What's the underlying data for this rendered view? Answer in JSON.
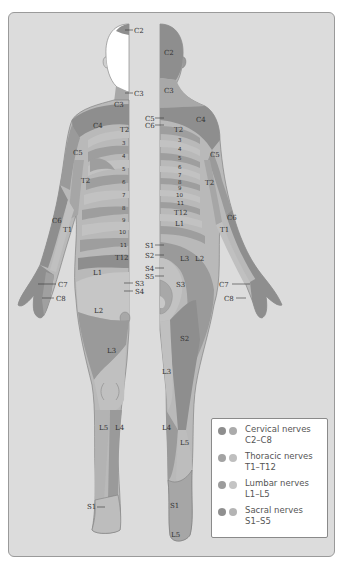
{
  "diagram": {
    "colors": {
      "background": "#dcdcdc",
      "body_light": "#b9b9b9",
      "cervical_dark": "#8e8e8e",
      "cervical_light": "#a8a8a8",
      "thoracic_dark": "#9a9a9a",
      "thoracic_light": "#bdbdbd",
      "lumbar_dark": "#959595",
      "lumbar_light": "#c2c2c2",
      "sacral_dark": "#8a8a8a",
      "sacral_light": "#b0b0b0"
    },
    "front_labels": {
      "c2_head": "C2",
      "c3_neck_arrow": "C3",
      "c3": "C3",
      "c4": "C4",
      "c5": "C5",
      "t2_chest": "T2",
      "t2_arm": "T2",
      "t3": "3",
      "t4": "4",
      "t5": "5",
      "t6": "6",
      "t7": "7",
      "t8": "8",
      "t9": "9",
      "t10": "10",
      "t11": "11",
      "t12": "T12",
      "c6": "C6",
      "t1": "T1",
      "c7": "C7",
      "c8": "C8",
      "l1": "L1",
      "s3": "S3",
      "s4": "S4",
      "l2": "L2",
      "l3": "L3",
      "l5": "L5",
      "l4": "L4",
      "s1": "S1"
    },
    "back_labels": {
      "c2": "C2",
      "c3": "C3",
      "c5_arrow": "C5",
      "c6_arrow": "C6",
      "c4": "C4",
      "t2": "T2",
      "t3": "3",
      "t4": "4",
      "t5": "5",
      "t6": "6",
      "t7": "7",
      "t8": "8",
      "t9": "9",
      "t10": "10",
      "t11": "11",
      "t12": "T12",
      "l1": "L1",
      "c5_arm": "C5",
      "t2_arm": "T2",
      "c6": "C6",
      "t1": "T1",
      "s1": "S1",
      "s2": "S2",
      "s4": "S4",
      "s5": "S5",
      "l3_hip": "L3",
      "l2": "L2",
      "s3": "S3",
      "c7": "C7",
      "c8": "C8",
      "s2_thigh": "S2",
      "l3_leg": "L3",
      "l4": "L4",
      "l5_calf": "L5",
      "s1_foot": "S1",
      "l5_foot": "L5"
    }
  },
  "legend": {
    "items": [
      {
        "title": "Cervical nerves",
        "range": "C2–C8",
        "dark": "#8e8e8e",
        "light": "#ababab"
      },
      {
        "title": "Thoracic nerves",
        "range": "T1–T12",
        "dark": "#a3a3a3",
        "light": "#bfbfbf"
      },
      {
        "title": "Lumbar nerves",
        "range": "L1–L5",
        "dark": "#9c9c9c",
        "light": "#c4c4c4"
      },
      {
        "title": "Sacral nerves",
        "range": "S1–S5",
        "dark": "#8f8f8f",
        "light": "#b4b4b4"
      }
    ]
  }
}
